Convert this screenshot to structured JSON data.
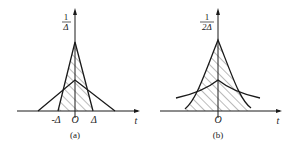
{
  "panels": [
    {
      "id": "a",
      "caption": "(a)",
      "y_label_num": "1",
      "y_label_den": "Δ",
      "x_axis_label": "t",
      "tick_labels": [
        "-Δ",
        "O",
        "Δ"
      ]
    },
    {
      "id": "b",
      "caption": "(b)",
      "y_label_num": "1",
      "y_label_den": "2Δ",
      "x_axis_label": "t",
      "tick_labels": [
        "O"
      ]
    }
  ],
  "colors": {
    "ink": "#1a1a1a",
    "background": "#ffffff"
  }
}
